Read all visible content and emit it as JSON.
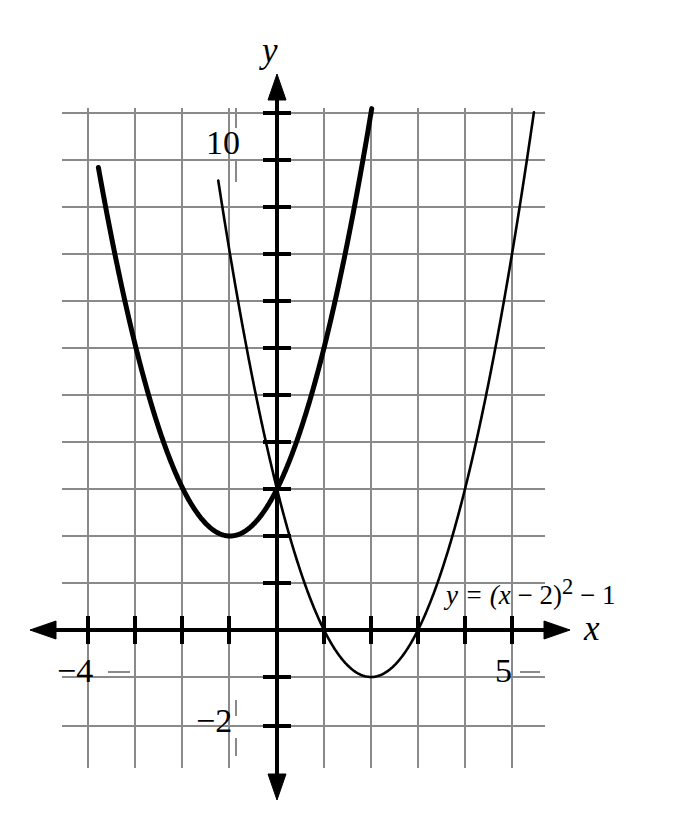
{
  "figure": {
    "kind": "coordinate-plane-graph",
    "background": "#ffffff",
    "ink_color": "#000000",
    "grid_color": "#808080"
  },
  "axis_labels": {
    "x_axis_letter": "x",
    "y_axis_letter": "y"
  },
  "tick_labels": {
    "y_ten": "10",
    "y_minus_two": "−2",
    "x_minus_four": "−4",
    "x_five": "5"
  },
  "annotations": {
    "equation_prefix": "y = (",
    "equation_var": "x",
    "equation_mid": " − 2)",
    "equation_exponent": "2",
    "equation_suffix": " − 1",
    "equation_full": "y = (x − 2)² − 1"
  },
  "chart_data": {
    "type": "line",
    "title": "",
    "xlabel": "x",
    "ylabel": "y",
    "xlim": [
      -4.6,
      5.7
    ],
    "ylim": [
      -2.8,
      11.2
    ],
    "grid": true,
    "grid_step": 1,
    "legend": "none",
    "x_ticks": [
      -4,
      -3,
      -2,
      -1,
      0,
      1,
      2,
      3,
      4,
      5
    ],
    "y_ticks": [
      -2,
      -1,
      0,
      1,
      2,
      3,
      4,
      5,
      6,
      7,
      8,
      9,
      10
    ],
    "labeled_x_ticks": [
      -4,
      5
    ],
    "labeled_y_ticks": [
      -2,
      10
    ],
    "series": [
      {
        "name": "thick-parabola",
        "equation": "y = (x + 1)^2 + 2",
        "stroke_width": 5,
        "vertex": [
          -1,
          2
        ],
        "x_domain": [
          -3.8,
          2.03
        ],
        "points": [
          [
            -3.8,
            9.84
          ],
          [
            -3.5,
            8.25
          ],
          [
            -3.0,
            6.0
          ],
          [
            -2.5,
            4.25
          ],
          [
            -2.0,
            3.0
          ],
          [
            -1.5,
            2.25
          ],
          [
            -1.0,
            2.0
          ],
          [
            -0.5,
            2.25
          ],
          [
            0.0,
            3.0
          ],
          [
            0.5,
            4.25
          ],
          [
            1.0,
            6.0
          ],
          [
            1.5,
            8.25
          ],
          [
            2.03,
            11.18
          ]
        ]
      },
      {
        "name": "thin-parabola",
        "equation": "y = (x - 2)^2 - 1",
        "stroke_width": 2.6,
        "vertex": [
          2,
          -1
        ],
        "roots": [
          1,
          3
        ],
        "x_domain": [
          -1.25,
          5.5
        ],
        "points": [
          [
            -1.25,
            9.56
          ],
          [
            -1.0,
            8.0
          ],
          [
            -0.5,
            5.25
          ],
          [
            0.0,
            3.0
          ],
          [
            0.5,
            1.25
          ],
          [
            1.0,
            0.0
          ],
          [
            1.5,
            -0.75
          ],
          [
            2.0,
            -1.0
          ],
          [
            2.5,
            -0.75
          ],
          [
            3.0,
            0.0
          ],
          [
            3.5,
            1.25
          ],
          [
            4.0,
            3.0
          ],
          [
            4.5,
            5.25
          ],
          [
            5.0,
            8.0
          ],
          [
            5.5,
            11.25
          ]
        ]
      }
    ],
    "intersections": [
      [
        0.5,
        4.25
      ]
    ]
  }
}
